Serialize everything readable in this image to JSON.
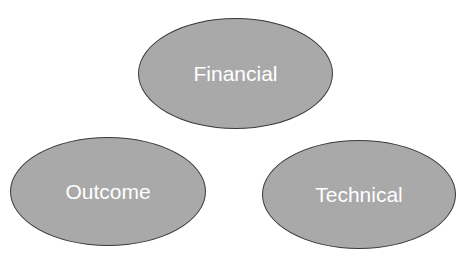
{
  "diagram": {
    "nodes": [
      {
        "id": "financial",
        "label": "Financial",
        "shape": "ellipse"
      },
      {
        "id": "outcome",
        "label": "Outcome",
        "shape": "ellipse"
      },
      {
        "id": "technical",
        "label": "Technical",
        "shape": "ellipse"
      }
    ],
    "edges": [],
    "colors": {
      "node_fill": "#a9a9a9",
      "node_border": "#3a3a3a",
      "label": "#ffffff",
      "background": "#ffffff"
    }
  }
}
